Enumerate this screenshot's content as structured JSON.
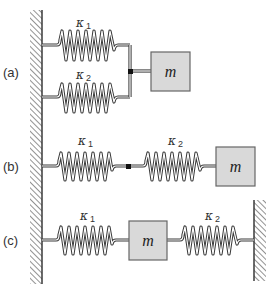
{
  "diagram": {
    "colors": {
      "mass_fill": "#d9d9d9",
      "mass_stroke": "#666666",
      "line": "#3a3a3a",
      "hatch": "#777777"
    },
    "configurations": [
      {
        "id": "a",
        "label": "(a)",
        "arrangement": "parallel",
        "springs": [
          {
            "symbol": "κ",
            "subscript": "1"
          },
          {
            "symbol": "κ",
            "subscript": "2"
          }
        ],
        "mass": {
          "label": "m"
        }
      },
      {
        "id": "b",
        "label": "(b)",
        "arrangement": "series",
        "springs": [
          {
            "symbol": "κ",
            "subscript": "1"
          },
          {
            "symbol": "κ",
            "subscript": "2"
          }
        ],
        "mass": {
          "label": "m"
        }
      },
      {
        "id": "c",
        "label": "(c)",
        "arrangement": "mass between two walls",
        "springs": [
          {
            "symbol": "κ",
            "subscript": "1"
          },
          {
            "symbol": "κ",
            "subscript": "2"
          }
        ],
        "mass": {
          "label": "m"
        }
      }
    ]
  }
}
